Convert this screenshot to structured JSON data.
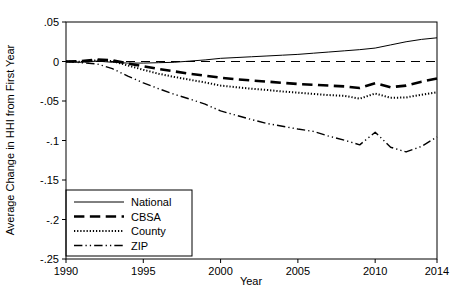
{
  "chart_data": {
    "type": "line",
    "title": "",
    "xlabel": "Year",
    "ylabel": "Average Change in HHI from First Year",
    "xlim": [
      1990,
      2014
    ],
    "ylim": [
      -0.25,
      0.05
    ],
    "grid": false,
    "legend_position": "bottom-left-inside",
    "xticks": [
      1990,
      1995,
      2000,
      2005,
      2010,
      2014
    ],
    "xtick_labels": [
      "1990",
      "1995",
      "2000",
      "2005",
      "2010",
      "2014"
    ],
    "yticks": [
      0.05,
      0,
      -0.05,
      -0.1,
      -0.15,
      -0.2,
      -0.25
    ],
    "ytick_labels": [
      ".05",
      "0",
      "-.05",
      "-.1",
      "-.15",
      "-.2",
      "-.25"
    ],
    "x": [
      1990,
      1991,
      1992,
      1993,
      1994,
      1995,
      1996,
      1997,
      1998,
      1999,
      2000,
      2001,
      2002,
      2003,
      2004,
      2005,
      2006,
      2007,
      2008,
      2009,
      2010,
      2011,
      2012,
      2013,
      2014
    ],
    "reference_line": {
      "value": 0,
      "style": "dashed",
      "label": ""
    },
    "series": [
      {
        "name": "National",
        "style": "solid",
        "width": 1,
        "color": "#000000",
        "values": [
          0,
          -0.001,
          0.0005,
          -0.001,
          -0.002,
          -0.002,
          -0.0015,
          -0.001,
          0.0005,
          0.002,
          0.004,
          0.005,
          0.006,
          0.007,
          0.008,
          0.009,
          0.0105,
          0.012,
          0.0135,
          0.015,
          0.017,
          0.021,
          0.025,
          0.028,
          0.03
        ]
      },
      {
        "name": "CBSA",
        "style": "dashed",
        "width": 2.6,
        "color": "#000000",
        "values": [
          0,
          0.0005,
          0.0025,
          0.0015,
          -0.0025,
          -0.006,
          -0.0095,
          -0.0125,
          -0.0155,
          -0.018,
          -0.0205,
          -0.0225,
          -0.024,
          -0.0255,
          -0.027,
          -0.0285,
          -0.0295,
          -0.0305,
          -0.0315,
          -0.0335,
          -0.0275,
          -0.0325,
          -0.0305,
          -0.0255,
          -0.0215
        ]
      },
      {
        "name": "County",
        "style": "dotted",
        "width": 2.0,
        "color": "#000000",
        "values": [
          0,
          -0.0005,
          0.0015,
          0.0005,
          -0.005,
          -0.0105,
          -0.0155,
          -0.0195,
          -0.023,
          -0.0265,
          -0.0305,
          -0.0325,
          -0.0345,
          -0.036,
          -0.038,
          -0.0395,
          -0.041,
          -0.0425,
          -0.0435,
          -0.047,
          -0.0405,
          -0.046,
          -0.0455,
          -0.042,
          -0.039
        ]
      },
      {
        "name": "ZIP",
        "style": "dashdot",
        "width": 1.4,
        "color": "#000000",
        "values": [
          0,
          -0.0015,
          -0.003,
          -0.009,
          -0.0185,
          -0.027,
          -0.0345,
          -0.0415,
          -0.0475,
          -0.054,
          -0.0625,
          -0.068,
          -0.0735,
          -0.0785,
          -0.082,
          -0.0855,
          -0.0885,
          -0.0945,
          -0.0995,
          -0.1055,
          -0.0895,
          -0.1085,
          -0.1145,
          -0.1075,
          -0.0955
        ]
      }
    ]
  },
  "legend": {
    "items": [
      {
        "label": "National"
      },
      {
        "label": "CBSA"
      },
      {
        "label": "County"
      },
      {
        "label": "ZIP"
      }
    ]
  }
}
